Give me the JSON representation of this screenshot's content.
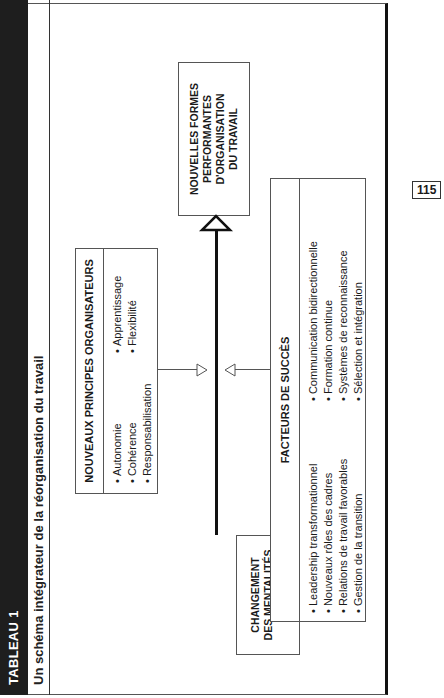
{
  "header": {
    "table_label": "TABLEAU 1",
    "title": "Un schéma intégrateur de la réorganisation du travail"
  },
  "page_number": "115",
  "diagram": {
    "principes": {
      "title": "NOUVEAUX PRINCIPES ORGANISATEURS",
      "col1": [
        "Autonomie",
        "Cohérence",
        "Responsabilisation"
      ],
      "col2": [
        "Apprentissage",
        "Flexibilité"
      ]
    },
    "resultat": {
      "lines": [
        "NOUVELLES FORMES",
        "PERFORMANTES",
        "D'ORGANISATION",
        "DU TRAVAIL"
      ]
    },
    "mentalites": {
      "lines": [
        "CHANGEMENT",
        "DES MENTALITÉS"
      ],
      "bullet": "Vision"
    },
    "facteurs": {
      "title": "FACTEURS DE SUCCÈS",
      "col1": [
        "Leadership transformationnel",
        "Nouveaux rôles des cadres",
        "Relations de travail favorables",
        "Gestion de la transition"
      ],
      "col2": [
        "Communication bidirectionnelle",
        "Formation continue",
        "Systèmes de reconnaissance",
        "Sélection et intégration"
      ]
    }
  }
}
